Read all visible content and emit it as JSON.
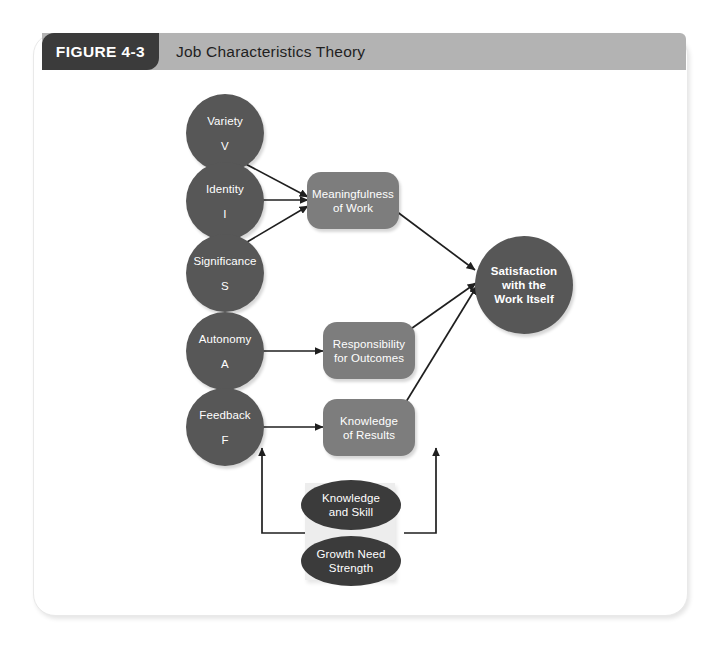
{
  "figure": {
    "tab_label": "FIGURE 4-3",
    "title": "Job Characteristics Theory",
    "colors": {
      "tab_background": "#3b3b3b",
      "header_background": "#b3b3b3",
      "circle_fill": "#575757",
      "rect_fill": "#7d7d7d",
      "ellipse_fill": "#3b3b3b",
      "moderator_panel": "#ededed",
      "arrow": "#1f1f1f",
      "node_text": "#ffffff"
    }
  },
  "nodes": {
    "core_characteristics": [
      {
        "title": "Variety",
        "abbrev": "V"
      },
      {
        "title": "Identity",
        "abbrev": "I"
      },
      {
        "title": "Significance",
        "abbrev": "S"
      },
      {
        "title": "Autonomy",
        "abbrev": "A"
      },
      {
        "title": "Feedback",
        "abbrev": "F"
      }
    ],
    "psychological_states": [
      {
        "line1": "Meaningfulness",
        "line2": "of Work"
      },
      {
        "line1": "Responsibility",
        "line2": "for Outcomes"
      },
      {
        "line1": "Knowledge",
        "line2": "of Results"
      }
    ],
    "outcome": {
      "line1": "Satisfaction",
      "line2": "with the",
      "line3": "Work Itself"
    },
    "moderators": [
      {
        "line1": "Knowledge",
        "line2": "and Skill"
      },
      {
        "line1": "Growth Need",
        "line2": "Strength"
      }
    ]
  }
}
